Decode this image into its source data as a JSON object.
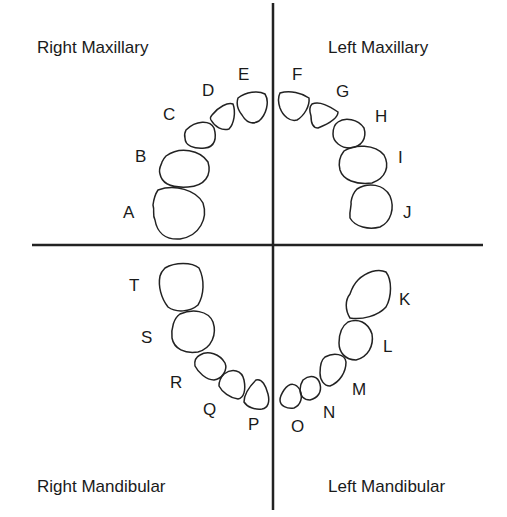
{
  "diagram": {
    "type": "primary dentition quadrant chart",
    "quadrants": {
      "upper_right": "Right Maxillary",
      "upper_left": "Left Maxillary",
      "lower_right": "Right Mandibular",
      "lower_left": "Left Mandibular"
    },
    "teeth": {
      "right_maxillary": [
        "A",
        "B",
        "C",
        "D",
        "E"
      ],
      "left_maxillary": [
        "F",
        "G",
        "H",
        "I",
        "J"
      ],
      "left_mandibular": [
        "K",
        "L",
        "M",
        "N",
        "O"
      ],
      "right_mandibular": [
        "P",
        "Q",
        "R",
        "S",
        "T"
      ]
    },
    "labels": {
      "A": "A",
      "B": "B",
      "C": "C",
      "D": "D",
      "E": "E",
      "F": "F",
      "G": "G",
      "H": "H",
      "I": "I",
      "J": "J",
      "K": "K",
      "L": "L",
      "M": "M",
      "N": "N",
      "O": "O",
      "P": "P",
      "Q": "Q",
      "R": "R",
      "S": "S",
      "T": "T"
    }
  }
}
